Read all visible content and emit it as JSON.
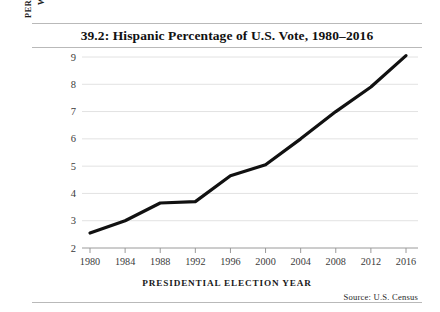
{
  "figure": {
    "title": "39.2: Hispanic Percentage of U.S. Vote, 1980–2016",
    "source_note": "Source:  U.S. Census",
    "axis_label_line1": "PERCENTAGE OF VOTERS",
    "axis_label_line2": "WHO ARE HISPANIC",
    "xlabel": "PRESIDENTIAL ELECTION YEAR",
    "line_color": "#111111",
    "grid_color": "#e2e2e2",
    "rule_color": "#b9b9b9"
  },
  "chart_data": {
    "type": "line",
    "title": "39.2: Hispanic Percentage of U.S. Vote, 1980–2016",
    "xlabel": "PRESIDENTIAL ELECTION YEAR",
    "ylabel": "PERCENTAGE OF VOTERS WHO ARE HISPANIC",
    "x": [
      1980,
      1984,
      1988,
      1992,
      1996,
      2000,
      2004,
      2008,
      2012,
      2016
    ],
    "xticklabels": [
      "1980",
      "1984",
      "1988",
      "1992",
      "1996",
      "2000",
      "2004",
      "2008",
      "2012",
      "2016"
    ],
    "values": [
      2.55,
      3.0,
      3.65,
      3.7,
      4.65,
      5.05,
      6.0,
      7.0,
      7.9,
      9.05
    ],
    "yticks": [
      2,
      3,
      4,
      5,
      6,
      7,
      8,
      9
    ],
    "yticklabels": [
      "2",
      "3",
      "4",
      "5",
      "6",
      "7",
      "8",
      "9"
    ],
    "xlim": [
      1980,
      2016
    ],
    "ylim": [
      2,
      9
    ],
    "grid": "horizontal",
    "legend": "none",
    "annotation": "Source:  U.S. Census"
  }
}
